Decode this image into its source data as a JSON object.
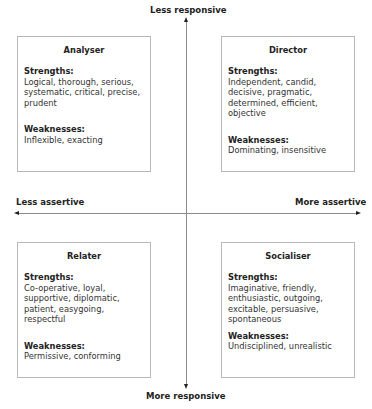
{
  "axes": {
    "top": "Less responsive",
    "bottom": "More responsive",
    "left": "Less assertive",
    "right": "More assertive"
  },
  "quadrants": {
    "analyser": {
      "title": "Analyser",
      "strengths_label": "Strengths:",
      "strengths": "Logical, thorough, serious, systematic, critical, precise, prudent",
      "weaknesses_label": "Weaknesses:",
      "weaknesses": "Inflexible, exacting"
    },
    "director": {
      "title": "Director",
      "strengths_label": "Strengths:",
      "strengths": "Independent, candid, decisive, pragmatic, determined, efficient, objective",
      "weaknesses_label": "Weaknesses:",
      "weaknesses": "Dominating, insensitive"
    },
    "relater": {
      "title": "Relater",
      "strengths_label": "Strengths:",
      "strengths": "Co-operative, loyal, supportive, diplomatic, patient, easygoing, respectful",
      "weaknesses_label": "Weaknesses:",
      "weaknesses": "Permissive, conforming"
    },
    "socialiser": {
      "title": "Socialiser",
      "strengths_label": "Strengths:",
      "strengths": "Imaginative, friendly, enthusiastic, outgoing, excitable, persuasive, spontaneous",
      "weaknesses_label": "Weaknesses:",
      "weaknesses": "Undisciplined, unrealistic"
    }
  }
}
